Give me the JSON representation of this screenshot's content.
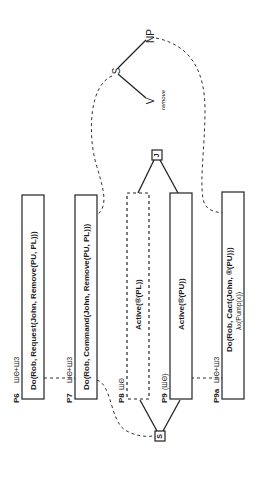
{
  "diagram": {
    "orientation": "rotated-90-ccw",
    "tree": {
      "root": "S",
      "children": [
        "NP",
        "V"
      ],
      "v_annotation": "remove"
    },
    "join_nodes": {
      "top": "J",
      "bottom": "S"
    },
    "boxes": [
      {
        "id": "P6",
        "tag": "ШΘ+Ш3",
        "content": "Do(Rob, Request(John, Remove(PU, PL)))",
        "content2": "",
        "style": "solid"
      },
      {
        "id": "P7",
        "tag": "ШΘ+Ш3",
        "content": "Do(Rob, Command(John, Remove(PU, PL)))",
        "content2": "",
        "style": "solid"
      },
      {
        "id": "P8",
        "tag": "ШΘ",
        "content": "Active(®(PL))",
        "content2": "",
        "style": "dashed"
      },
      {
        "id": "P9",
        "tag": "(ШΘ)",
        "content": "Active(®(PU))",
        "content2": "",
        "style": "solid"
      },
      {
        "id": "P9a",
        "tag": "ШΘ+Ш3",
        "content": "Do(Rob, Cact(John, ®(PU)))",
        "content2": "λx(Pump(x))",
        "style": "solid"
      }
    ]
  }
}
